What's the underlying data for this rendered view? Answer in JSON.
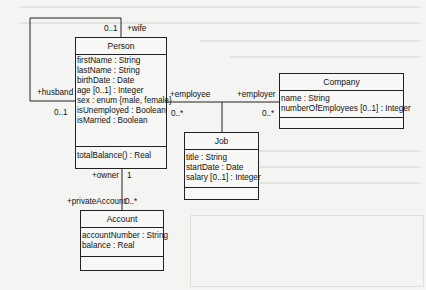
{
  "diagram": {
    "type": "UML class diagram",
    "classes": {
      "person": {
        "name": "Person",
        "attributes": [
          "firstName : String",
          "lastName : String",
          "birthDate : Date",
          "age [0..1] : Integer",
          "sex : enum {male, female}",
          "isUnemployed : Boolean",
          "isMarried : Boolean"
        ],
        "operations": [
          "totalBalance() : Real"
        ]
      },
      "company": {
        "name": "Company",
        "attributes": [
          "name : String",
          "numberOfEmployees [0..1] : Integer"
        ],
        "operations": []
      },
      "job": {
        "name": "Job",
        "attributes": [
          "title : String",
          "startDate : Date",
          "salary [0..1] : Integer"
        ],
        "operations": []
      },
      "account": {
        "name": "Account",
        "attributes": [
          "accountNumber : String",
          "balance : Real"
        ],
        "operations": []
      }
    },
    "associations": {
      "marriage": {
        "wife_role": "+wife",
        "wife_mult": "0..1",
        "husband_role": "+husband",
        "husband_mult": "0..1"
      },
      "employment": {
        "employee_role": "+employee",
        "employee_mult": "0..*",
        "employer_role": "+employer",
        "employer_mult": "0..*",
        "association_class": "Job"
      },
      "ownership": {
        "owner_role": "+owner",
        "owner_mult": "1",
        "account_role": "+privateAccount",
        "account_mult": "0..*"
      }
    }
  }
}
